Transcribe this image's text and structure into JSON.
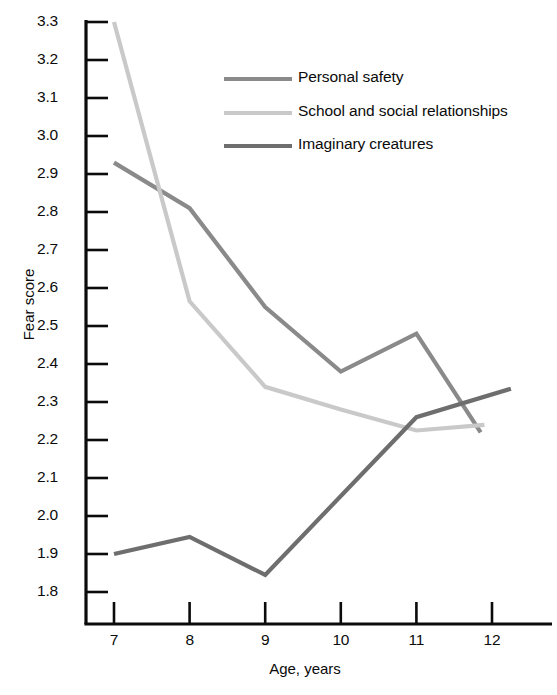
{
  "chart_data": {
    "type": "line",
    "title": "",
    "xlabel": "Age, years",
    "ylabel": "Fear score",
    "xlim": [
      6.45,
      12.55
    ],
    "ylim": [
      1.745,
      3.34
    ],
    "grid": false,
    "x_ticks": [
      7,
      8,
      9,
      10,
      11,
      12
    ],
    "x_tick_labels": [
      "7",
      "8",
      "9",
      "10",
      "11",
      "12"
    ],
    "y_ticks": [
      1.8,
      1.9,
      2.0,
      2.1,
      2.2,
      2.3,
      2.4,
      2.5,
      2.6,
      2.7,
      2.8,
      2.9,
      3.0,
      3.1,
      3.2,
      3.3
    ],
    "y_tick_labels": [
      "1.8",
      "1.9",
      "2.0",
      "2.1",
      "2.2",
      "2.3",
      "2.4",
      "2.5",
      "2.6",
      "2.7",
      "2.8",
      "2.9",
      "3.0",
      "3.1",
      "3.2",
      "3.3"
    ],
    "legend_position": "upper center",
    "series": [
      {
        "name": "Personal safety",
        "color": "#8a8a8a",
        "x": [
          7,
          8,
          9,
          10,
          11,
          11.85
        ],
        "values": [
          2.93,
          2.81,
          2.55,
          2.38,
          2.48,
          2.22
        ]
      },
      {
        "name": "School and social relationships",
        "color": "#c9c9c9",
        "x": [
          7,
          8,
          9,
          10,
          11,
          11.9
        ],
        "values": [
          3.3,
          2.565,
          2.34,
          2.28,
          2.225,
          2.24
        ]
      },
      {
        "name": "Imaginary creatures",
        "color": "#6e6e6e",
        "x": [
          7,
          8,
          9,
          11,
          12.25
        ],
        "values": [
          1.9,
          1.945,
          1.845,
          2.26,
          2.335
        ]
      }
    ]
  },
  "legend": {
    "entries": [
      {
        "label": "Personal safety",
        "color": "#8a8a8a"
      },
      {
        "label": "School and social relationships",
        "color": "#c9c9c9"
      },
      {
        "label": "Imaginary creatures",
        "color": "#6e6e6e"
      }
    ]
  },
  "axes": {
    "x_title": "Age, years",
    "y_title": "Fear score",
    "axis_color": "#0b0b0b"
  }
}
